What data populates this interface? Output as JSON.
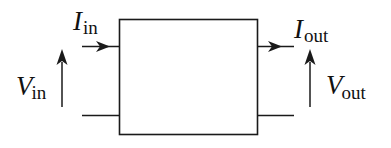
{
  "diagram": {
    "type": "two-port network block",
    "labels": {
      "input_current": {
        "symbol": "I",
        "subscript": "in"
      },
      "input_voltage": {
        "symbol": "V",
        "subscript": "in"
      },
      "output_current": {
        "symbol": "I",
        "subscript": "out"
      },
      "output_voltage": {
        "symbol": "V",
        "subscript": "out"
      }
    },
    "stroke_color": "#1a1a1a",
    "background": "#ffffff"
  }
}
